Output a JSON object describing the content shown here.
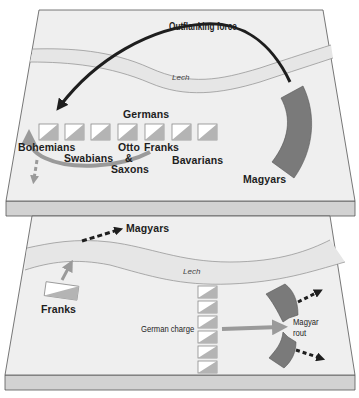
{
  "colors": {
    "plane_surface": "#efefef",
    "plane_edge_face": "#d2d2d2",
    "plane_outline": "#555555",
    "river_fill": "#e6e6e6",
    "river_bank": "#8c8c8c",
    "outflank_arrow": "#1e1e1e",
    "german_unit_light": "#ffffff",
    "german_unit_shade": "#b4b4b4",
    "german_unit_border": "#8a8a8a",
    "magyar_fill": "#7a7a7a",
    "grey_arrow": "#9a9a9a",
    "dashed_arrow": "#1e1e1e"
  },
  "top_panel": {
    "name": "Phase 1",
    "outflanking_label": "Outflanking force",
    "river_label": "Lech",
    "germans_label": "Germans",
    "german_units": [
      {
        "id": "unit-1"
      },
      {
        "id": "unit-2"
      },
      {
        "id": "unit-3"
      },
      {
        "id": "unit-4"
      },
      {
        "id": "unit-5"
      },
      {
        "id": "unit-6"
      },
      {
        "id": "unit-7"
      }
    ],
    "contingent_labels": {
      "bohemians": "Bohemians",
      "swabians": "Swabians",
      "otto": "Otto",
      "franks": "Franks",
      "ampersand": "&",
      "saxons": "Saxons",
      "bavarians": "Bavarians"
    },
    "magyars_label": "Magyars"
  },
  "bottom_panel": {
    "name": "Phase 2",
    "magyars_label": "Magyars",
    "river_label": "Lech",
    "franks_label": "Franks",
    "german_charge_label": "German charge",
    "german_units": [
      {
        "id": "unit-1"
      },
      {
        "id": "unit-2"
      },
      {
        "id": "unit-3"
      },
      {
        "id": "unit-4"
      },
      {
        "id": "unit-5"
      },
      {
        "id": "unit-6"
      }
    ],
    "magyar_rout_label_line1": "Magyar",
    "magyar_rout_label_line2": "rout"
  }
}
